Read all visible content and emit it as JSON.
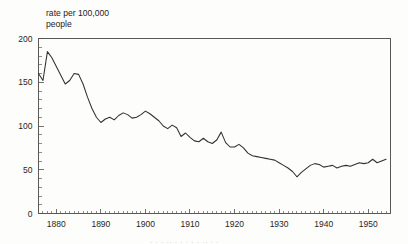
{
  "figure": {
    "title_line1": "rate per 100,000",
    "title_line2": "people",
    "background_color": "#fdfdfc",
    "line_color": "#303030",
    "axis_color": "#595959"
  },
  "caption": {
    "cut_off_text": "· · ·   ·· ·   · · · ·   ·· · ·"
  },
  "chart_data": {
    "type": "line",
    "title": "rate per 100,000 people",
    "xlabel": "",
    "ylabel": "rate per 100,000 people",
    "xlim": [
      1876,
      1955
    ],
    "ylim": [
      0,
      200
    ],
    "grid": false,
    "legend": false,
    "y_ticks_major": [
      0,
      50,
      100,
      150,
      200
    ],
    "y_tick_labels": [
      "0",
      "50",
      "100",
      "150",
      "200"
    ],
    "y_tick_minor_step": 10,
    "x_ticks_major": [
      1880,
      1890,
      1900,
      1910,
      1920,
      1930,
      1940,
      1950
    ],
    "x_tick_labels": [
      "1880",
      "1890",
      "1900",
      "1910",
      "1920",
      "1930",
      "1940",
      "1950"
    ],
    "x_tick_minor_step": 1,
    "series": [
      {
        "name": "rate per 100,000 people",
        "x": [
          1876,
          1877,
          1878,
          1879,
          1880,
          1881,
          1882,
          1883,
          1884,
          1885,
          1886,
          1887,
          1888,
          1889,
          1890,
          1891,
          1892,
          1893,
          1894,
          1895,
          1896,
          1897,
          1898,
          1899,
          1900,
          1901,
          1902,
          1903,
          1904,
          1905,
          1906,
          1907,
          1908,
          1909,
          1910,
          1911,
          1912,
          1913,
          1914,
          1915,
          1916,
          1917,
          1918,
          1919,
          1920,
          1921,
          1922,
          1923,
          1924,
          1925,
          1926,
          1927,
          1928,
          1929,
          1930,
          1931,
          1932,
          1933,
          1934,
          1935,
          1936,
          1937,
          1938,
          1939,
          1940,
          1941,
          1942,
          1943,
          1944,
          1945,
          1946,
          1947,
          1948,
          1949,
          1950,
          1951,
          1952,
          1953,
          1954
        ],
        "values": [
          160,
          152,
          185,
          178,
          168,
          158,
          148,
          152,
          160,
          159,
          148,
          133,
          120,
          110,
          104,
          108,
          110,
          107,
          112,
          115,
          113,
          109,
          110,
          113,
          117,
          114,
          110,
          106,
          100,
          97,
          101,
          98,
          88,
          92,
          87,
          83,
          82,
          86,
          82,
          80,
          84,
          93,
          81,
          76,
          76,
          79,
          75,
          69,
          66,
          65,
          64,
          63,
          62,
          61,
          58,
          55,
          52,
          48,
          42,
          47,
          51,
          55,
          57,
          56,
          53,
          54,
          55,
          52,
          54,
          55,
          54,
          56,
          58,
          57,
          58,
          62,
          58,
          60,
          62
        ]
      }
    ]
  }
}
